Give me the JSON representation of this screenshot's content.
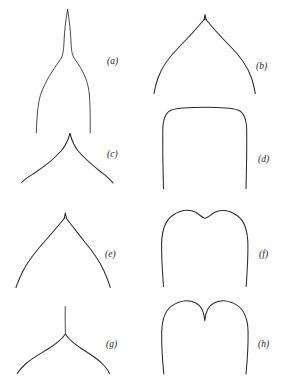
{
  "figure": {
    "kind": "scientific-line-diagram",
    "title": "",
    "caption": "",
    "background_color": "#ffffff",
    "stroke_color": "#2b2b2b",
    "width": 287,
    "height": 381,
    "columns": 2,
    "rows": 4
  },
  "panels": [
    {
      "id": "a",
      "label": "(a)",
      "shape_name": "long-attenuate-caudate-apex",
      "description": "very long narrow tapering tip flaring to wide concave shoulders",
      "label_x": 107,
      "label_y": 57,
      "column": "left",
      "row": 1
    },
    {
      "id": "b",
      "label": "(b)",
      "shape_name": "broad-acute-apiculate-apex",
      "description": "wide convex arch rising to a small sharp point",
      "label_x": 256,
      "label_y": 62,
      "column": "right",
      "row": 1
    },
    {
      "id": "c",
      "label": "(c)",
      "shape_name": "acuminate-apex",
      "description": "concave-sided tapering point above spreading shoulders",
      "label_x": 107,
      "label_y": 150,
      "column": "left",
      "row": 2
    },
    {
      "id": "d",
      "label": "(d)",
      "shape_name": "truncate-apex",
      "description": "flat top with rounded corners and straight sides",
      "label_x": 258,
      "label_y": 155,
      "column": "right",
      "row": 2
    },
    {
      "id": "e",
      "label": "(e)",
      "shape_name": "acute-apex",
      "description": "narrow convex arch meeting at a pointed tip",
      "label_x": 105,
      "label_y": 250,
      "column": "left",
      "row": 3
    },
    {
      "id": "f",
      "label": "(f)",
      "shape_name": "retuse-apex",
      "description": "broadly rounded top with a shallow central notch",
      "label_x": 259,
      "label_y": 250,
      "column": "right",
      "row": 3
    },
    {
      "id": "g",
      "label": "(g)",
      "shape_name": "aristate-mucronate-apex",
      "description": "obtuse rounded shoulders bearing a slender bristle",
      "label_x": 106,
      "label_y": 340,
      "column": "left",
      "row": 4
    },
    {
      "id": "h",
      "label": "(h)",
      "shape_name": "emarginate-bilobed-apex",
      "description": "two rounded lobes separated by a deep narrow sinus",
      "label_x": 258,
      "label_y": 340,
      "column": "right",
      "row": 4
    }
  ]
}
